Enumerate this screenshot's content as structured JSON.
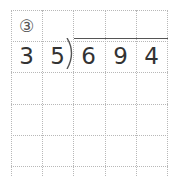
{
  "problem": {
    "label": "③",
    "divisor": [
      "3",
      "5"
    ],
    "dividend": [
      "6",
      "9",
      "4"
    ]
  },
  "grid": {
    "columns": 5,
    "rows": 6,
    "line_color": "#b8b8b8"
  }
}
